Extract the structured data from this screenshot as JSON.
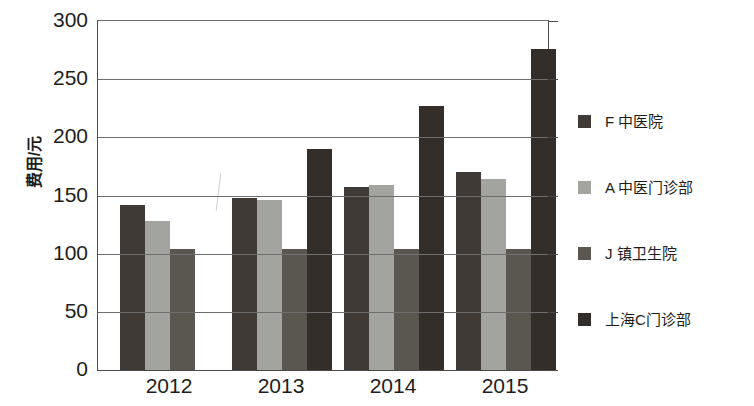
{
  "chart_data": {
    "type": "bar",
    "title": "",
    "subtitle": "",
    "xlabel": "",
    "ylabel": "费用/元",
    "categories": [
      "2012",
      "2013",
      "2014",
      "2015"
    ],
    "ylim": [
      0,
      300
    ],
    "ytick_values": [
      0,
      50,
      100,
      150,
      200,
      250,
      300
    ],
    "ytick_labels": [
      "0",
      "50",
      "100",
      "150",
      "200",
      "250",
      "300"
    ],
    "grid": true,
    "legend_position": "right",
    "series": [
      {
        "name": "F 中医院",
        "color": "#3f3a35",
        "values": [
          142,
          148,
          157,
          170
        ]
      },
      {
        "name": "A 中医门诊部",
        "color": "#a3a3a0",
        "values": [
          128,
          146,
          159,
          164
        ]
      },
      {
        "name": "J 镇卫生院",
        "color": "#5a5650",
        "values": [
          104,
          104,
          104,
          104
        ]
      },
      {
        "name": "上海C门诊部",
        "color": "#332e2a",
        "values": [
          null,
          190,
          227,
          276
        ]
      }
    ]
  },
  "axis": {
    "y_title": "费用/元",
    "y_ticks": [
      "300",
      "250",
      "200",
      "150",
      "100",
      "50",
      "0"
    ],
    "x_ticks": [
      "2012",
      "2013",
      "2014",
      "2015"
    ]
  },
  "legend": {
    "items": [
      {
        "label": "F 中医院",
        "color": "#3f3a35"
      },
      {
        "label": "A 中医门诊部",
        "color": "#a3a3a0"
      },
      {
        "label": "J 镇卫生院",
        "color": "#5a5650"
      },
      {
        "label": "上海C门诊部",
        "color": "#332e2a"
      }
    ]
  }
}
